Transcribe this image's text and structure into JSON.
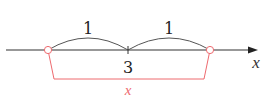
{
  "diagram": {
    "colors": {
      "axis": "#333333",
      "arc": "#555555",
      "highlight": "#ee6a6f",
      "text": "#222222"
    },
    "axis_label": "x",
    "center_label": "3",
    "left_arc_label": "1",
    "right_arc_label": "1",
    "bracket_label": "x",
    "points": [
      {
        "name": "left-point",
        "value": 2,
        "style": "open-circle"
      },
      {
        "name": "center-point",
        "value": 3,
        "style": "tick"
      },
      {
        "name": "right-point",
        "value": 4,
        "style": "open-circle"
      }
    ]
  }
}
